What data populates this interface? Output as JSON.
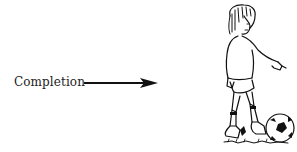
{
  "label": {
    "text": "Completion"
  },
  "arrow": {
    "direction": "right",
    "color": "#111111"
  },
  "illustration": {
    "subject": "soccer-player-kicking-ball",
    "style": "black-ink-line-drawing"
  }
}
